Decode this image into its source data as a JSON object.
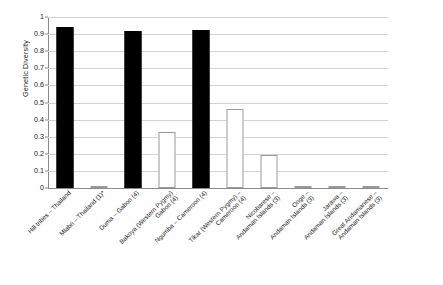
{
  "chart_data": {
    "type": "bar",
    "title": "",
    "subtitle": "",
    "xlabel": "",
    "ylabel": "Genetic Diversity",
    "ylim": [
      0,
      1
    ],
    "ytick_labels": [
      "1",
      "0.9",
      "0.8",
      "0.7",
      "0.6",
      "0.5",
      "0.4",
      "0.3",
      "0.2",
      "0.1",
      "0"
    ],
    "ytick_values": [
      1,
      0.9,
      0.8,
      0.7,
      0.6,
      0.5,
      0.4,
      0.3,
      0.2,
      0.1,
      0
    ],
    "grid": true,
    "legend": "none",
    "categories": [
      "Hill tribes – Thailand",
      "Mlabri – Thailand (1)*",
      "Duma – Gabon (4)",
      "Bakoya (Western Pygmy) – Gabon (4)",
      "Ngumba – Cameroon (4)",
      "Tikar (Western Pygmy) – Cameroon (4)",
      "Nicobarese – Andaman Islands (3)",
      "Onge – Andaman Islands (3)",
      "Jarawa – Andaman Islands (3)",
      "Great Andamanese – Andaman Islands (3)"
    ],
    "category_lines": [
      [
        "Hill tribes – Thailand"
      ],
      [
        "Mlabri – Thailand (1)*"
      ],
      [
        "Duma – Gabon (4)"
      ],
      [
        "Bakoya (Western Pygmy)",
        "Gabon (4)"
      ],
      [
        "Ngumba – Cameroon (4)"
      ],
      [
        "Tikar (Western Pygmy) –",
        "Cameroon (4)"
      ],
      [
        "Nicobarese –",
        "Andaman Islands (3)"
      ],
      [
        "Onge –",
        "Andaman Islands (3)"
      ],
      [
        "Jarawa –",
        "Andaman Islands (3)"
      ],
      [
        "Great Andamanese –",
        "Andaman Islands (3)"
      ]
    ],
    "values": [
      0.94,
      0.0,
      0.92,
      0.325,
      0.925,
      0.46,
      0.195,
      0.005,
      0.005,
      0.005
    ],
    "bar_styles": [
      "filled",
      "hollow",
      "filled",
      "hollow",
      "filled",
      "hollow",
      "hollow",
      "hollow",
      "hollow",
      "hollow"
    ],
    "colors": {
      "filled_bar": "#000000",
      "hollow_bar_fill": "#ffffff",
      "hollow_bar_border": "#9a9a9a",
      "gridline": "#d3d3d3",
      "axis": "#8a8a8a",
      "text": "#1a1a1a",
      "background": "#ffffff"
    }
  }
}
